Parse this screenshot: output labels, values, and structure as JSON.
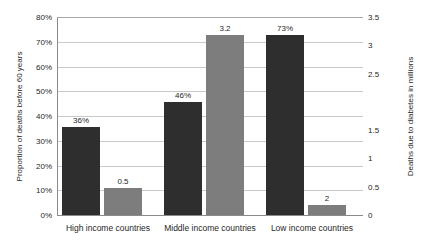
{
  "chart_data": {
    "type": "bar",
    "title": "",
    "categories": [
      "High income countries",
      "Middle income countries",
      "Low income countries"
    ],
    "series": [
      {
        "name": "Proportion of deaths before 60 years",
        "axis": "left",
        "color": "#2e2e2e",
        "values": [
          36,
          46,
          73
        ],
        "labels": [
          "36%",
          "46%",
          "73%"
        ]
      },
      {
        "name": "Deaths due to diabetes in millions",
        "axis": "right",
        "color": "#7d7d7d",
        "values": [
          0.5,
          3.2,
          0.2
        ],
        "labels": [
          "0.5",
          "3.2",
          "2"
        ]
      }
    ],
    "left_axis": {
      "label": "Proportion of deaths before 60 years",
      "ticks": [
        "0%",
        "10%",
        "20%",
        "30%",
        "40%",
        "50%",
        "60%",
        "70%",
        "80%"
      ],
      "tick_values": [
        0,
        10,
        20,
        30,
        40,
        50,
        60,
        70,
        80
      ],
      "ylim": [
        0,
        80
      ]
    },
    "right_axis": {
      "label": "Deaths due to diabetes in millions",
      "ticks": [
        "0",
        "0.5",
        "1",
        "1.5",
        "",
        "2.5",
        "3",
        "3.5"
      ],
      "tick_values": [
        0,
        0.5,
        1,
        1.5,
        2,
        2.5,
        3,
        3.5
      ],
      "ylim": [
        0,
        3.5
      ]
    },
    "grid": true,
    "legend": "none",
    "xlabel": "",
    "ylabel": "Proportion of deaths before 60 years"
  }
}
